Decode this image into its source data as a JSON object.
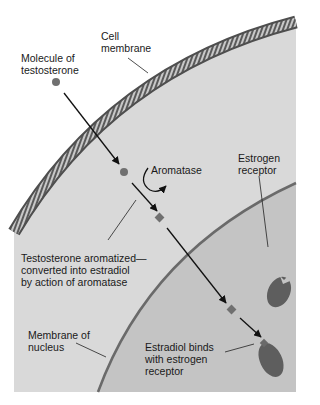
{
  "figure": {
    "type": "biology-diagram",
    "colors": {
      "background": "#ffffff",
      "cytoplasm": "#d9d9d9",
      "nucleus": "#c4c4c4",
      "membrane_dark": "#5a5a5a",
      "membrane_light": "#bdbdbd",
      "molecule": "#707070",
      "receptor": "#5e5e5e",
      "arrow": "#111111"
    }
  },
  "labels": {
    "cell_membrane": "Cell\nmembrane",
    "testosterone": "Molecule of\ntestosterone",
    "aromatase": "Aromatase",
    "estrogen_receptor": "Estrogen\nreceptor",
    "aromatized": "Testosterone aromatized—\nconverted into estradiol\nby action of aromatase",
    "nucleus_membrane": "Membrane of\nnucleus",
    "estradiol_binds": "Estradiol binds\nwith estrogen\nreceptor"
  }
}
